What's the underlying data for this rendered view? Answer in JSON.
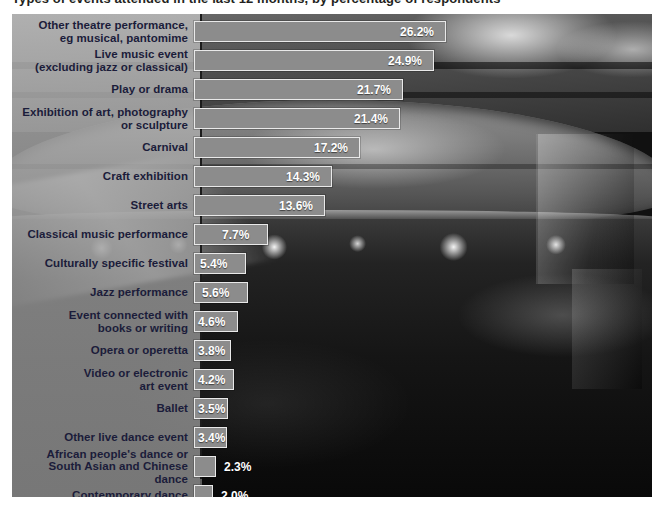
{
  "chart_title": "Types of events attended in the last 12 months, by percentage of respondents",
  "background": {
    "photo_description": "grayscale photograph of a theatre auditorium interior with balcony and stage lights",
    "panel_left": 12,
    "panel_top": 14
  },
  "colors": {
    "bar_fill": "#8c8c8c",
    "bar_border": "#e9e9e9",
    "label_text": "#1b1c3a",
    "value_text": "#ffffff",
    "axis_line": "#1c1c1c",
    "page_background": "#ffffff"
  },
  "chart_data": {
    "type": "bar",
    "orientation": "horizontal",
    "title": "Types of events attended in the last 12 months, by percentage of respondents",
    "xlabel": "",
    "ylabel": "",
    "xlim": [
      0,
      28
    ],
    "grid": false,
    "legend": null,
    "value_suffix": "%",
    "categories": [
      "Other theatre performance, eg musical, pantomime",
      "Live music event (excluding jazz or classical)",
      "Play or drama",
      "Exhibition of art, photography or sculpture",
      "Carnival",
      "Craft exhibition",
      "Street arts",
      "Classical music performance",
      "Culturally specific festival",
      "Jazz performance",
      "Event connected with books or writing",
      "Opera or operetta",
      "Video or electronic art event",
      "Ballet",
      "Other live dance event",
      "African people's dance or South Asian and Chinese dance",
      "Contemporary dance"
    ],
    "values": [
      26.2,
      24.9,
      21.7,
      21.4,
      17.2,
      14.3,
      13.6,
      7.7,
      5.4,
      5.6,
      4.6,
      3.8,
      4.2,
      3.5,
      3.4,
      2.3,
      2.0
    ]
  },
  "rows": [
    {
      "label_line1": "Other theatre performance,",
      "label_line2": "eg musical, pantomime",
      "value": 26.2,
      "value_text": "26.2%",
      "inside": true
    },
    {
      "label_line1": "Live music event",
      "label_line2": "(excluding jazz or classical)",
      "value": 24.9,
      "value_text": "24.9%",
      "inside": true
    },
    {
      "label_line1": "Play or drama",
      "label_line2": "",
      "value": 21.7,
      "value_text": "21.7%",
      "inside": true
    },
    {
      "label_line1": "Exhibition of art, photography",
      "label_line2": "or sculpture",
      "value": 21.4,
      "value_text": "21.4%",
      "inside": true
    },
    {
      "label_line1": "Carnival",
      "label_line2": "",
      "value": 17.2,
      "value_text": "17.2%",
      "inside": true
    },
    {
      "label_line1": "Craft exhibition",
      "label_line2": "",
      "value": 14.3,
      "value_text": "14.3%",
      "inside": true
    },
    {
      "label_line1": "Street arts",
      "label_line2": "",
      "value": 13.6,
      "value_text": "13.6%",
      "inside": true
    },
    {
      "label_line1": "Classical music performance",
      "label_line2": "",
      "value": 7.7,
      "value_text": "7.7%",
      "inside": true
    },
    {
      "label_line1": "Culturally specific festival",
      "label_line2": "",
      "value": 5.4,
      "value_text": "5.4%",
      "inside": true
    },
    {
      "label_line1": "Jazz performance",
      "label_line2": "",
      "value": 5.6,
      "value_text": "5.6%",
      "inside": true
    },
    {
      "label_line1": "Event connected with",
      "label_line2": "books or writing",
      "value": 4.6,
      "value_text": "4.6%",
      "inside": true
    },
    {
      "label_line1": "Opera or operetta",
      "label_line2": "",
      "value": 3.8,
      "value_text": "3.8%",
      "inside": true
    },
    {
      "label_line1": "Video or electronic",
      "label_line2": "art event",
      "value": 4.2,
      "value_text": "4.2%",
      "inside": true
    },
    {
      "label_line1": "Ballet",
      "label_line2": "",
      "value": 3.5,
      "value_text": "3.5%",
      "inside": true
    },
    {
      "label_line1": "Other live dance event",
      "label_line2": "",
      "value": 3.4,
      "value_text": "3.4%",
      "inside": true
    },
    {
      "label_line1": "African people's dance or",
      "label_line2": "South Asian and Chinese dance",
      "value": 2.3,
      "value_text": "2.3%",
      "inside": false
    },
    {
      "label_line1": "Contemporary dance",
      "label_line2": "",
      "value": 2.0,
      "value_text": "2.0%",
      "inside": false
    }
  ]
}
